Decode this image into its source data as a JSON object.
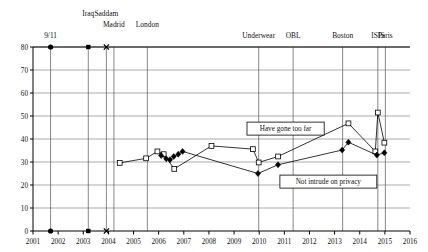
{
  "chart_data": {
    "type": "line",
    "title": "",
    "subtitle": "",
    "xlabel": "",
    "ylabel": "",
    "xlim": [
      2001,
      2016
    ],
    "ylim": [
      0,
      80
    ],
    "grid": true,
    "legend_position": "inline-callouts",
    "x_ticks": [
      "2001",
      "2002",
      "2003",
      "2004",
      "2005",
      "2006",
      "2007",
      "2008",
      "2009",
      "2010",
      "2011",
      "2012",
      "2013",
      "2014",
      "2015",
      "2016"
    ],
    "y_ticks": [
      "0",
      "10",
      "20",
      "30",
      "40",
      "50",
      "60",
      "70",
      "80"
    ],
    "series": [
      {
        "name": "Have gone too far",
        "marker": "open-square",
        "label_text": "Have gone too far",
        "points": [
          {
            "x": 2004.45,
            "y": 29.6
          },
          {
            "x": 2005.5,
            "y": 31.6
          },
          {
            "x": 2005.95,
            "y": 34.6
          },
          {
            "x": 2006.2,
            "y": 33.4
          },
          {
            "x": 2006.62,
            "y": 27.0
          },
          {
            "x": 2008.1,
            "y": 37.0
          },
          {
            "x": 2009.75,
            "y": 35.6
          },
          {
            "x": 2009.98,
            "y": 29.8
          },
          {
            "x": 2010.75,
            "y": 32.4
          },
          {
            "x": 2013.55,
            "y": 46.8
          },
          {
            "x": 2014.62,
            "y": 34.6
          },
          {
            "x": 2014.72,
            "y": 51.5
          },
          {
            "x": 2014.98,
            "y": 38.4
          }
        ]
      },
      {
        "name": "Not intrude on privacy",
        "marker": "filled-diamond",
        "label_text": "Not intrude on privacy",
        "points": [
          {
            "x": 2006.1,
            "y": 32.8
          },
          {
            "x": 2006.3,
            "y": 31.4
          },
          {
            "x": 2006.45,
            "y": 31.0
          },
          {
            "x": 2006.6,
            "y": 32.4
          },
          {
            "x": 2006.78,
            "y": 33.4
          },
          {
            "x": 2006.95,
            "y": 34.6
          },
          {
            "x": 2009.95,
            "y": 25.0
          },
          {
            "x": 2010.75,
            "y": 28.8
          },
          {
            "x": 2013.3,
            "y": 35.2
          },
          {
            "x": 2013.55,
            "y": 38.6
          },
          {
            "x": 2014.68,
            "y": 33.0
          },
          {
            "x": 2014.98,
            "y": 34.0
          }
        ]
      }
    ],
    "events": [
      {
        "label": "9/11",
        "x": 2001.7,
        "label_row": 2,
        "marker": "filled-circle",
        "marker_y": 80,
        "baseline_marker": true
      },
      {
        "label": "Iraq",
        "x": 2003.2,
        "label_row": 0,
        "marker": "filled-square",
        "marker_y": 80,
        "baseline_marker": true
      },
      {
        "label": "Saddam",
        "x": 2003.92,
        "label_row": 0,
        "marker": "cross",
        "marker_y": 80,
        "baseline_marker": true
      },
      {
        "label": "Madrid",
        "x": 2004.22,
        "label_row": 1,
        "marker": "none",
        "marker_y": 80,
        "baseline_marker": false
      },
      {
        "label": "London",
        "x": 2005.55,
        "label_row": 1,
        "marker": "none",
        "marker_y": 80,
        "baseline_marker": false
      },
      {
        "label": "Underwear",
        "x": 2009.98,
        "label_row": 2,
        "marker": "none",
        "marker_y": 80,
        "baseline_marker": false
      },
      {
        "label": "OBL",
        "x": 2011.35,
        "label_row": 2,
        "marker": "none",
        "marker_y": 80,
        "baseline_marker": false
      },
      {
        "label": "Boston",
        "x": 2013.32,
        "label_row": 2,
        "marker": "none",
        "marker_y": 80,
        "baseline_marker": false
      },
      {
        "label": "ISIS",
        "x": 2014.72,
        "label_row": 2,
        "marker": "none",
        "marker_y": 80,
        "baseline_marker": false
      },
      {
        "label": "Paris",
        "x": 2015.02,
        "label_row": 2,
        "marker": "none",
        "marker_y": 80,
        "baseline_marker": false
      }
    ],
    "callouts": [
      {
        "text": "Have gone too far",
        "x": 2011.05,
        "y": 44.5
      },
      {
        "text": "Not intrude on privacy",
        "x": 2012.75,
        "y": 21.5
      }
    ]
  },
  "colors": {
    "axis": "#000000",
    "grid": "#888888",
    "series_gone_too_far": "#000000",
    "series_not_intrude": "#000000",
    "event_line": "#555555",
    "callout_border": "#000000",
    "background": "#ffffff"
  }
}
